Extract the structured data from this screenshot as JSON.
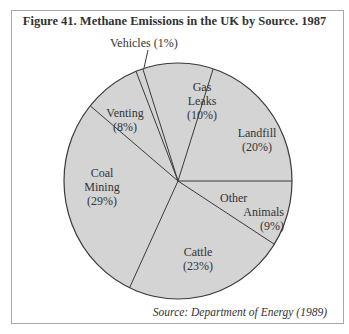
{
  "chart_data": {
    "type": "pie",
    "title": "Figure 41.  Methane Emissions in the UK by Source. 1987",
    "source": "Source: Department of Energy (1989)",
    "slices": [
      {
        "label": "Landfill",
        "value": 20,
        "display": "(20%)"
      },
      {
        "label": "Other Animals",
        "value": 9,
        "display": "(9%)"
      },
      {
        "label": "Cattle",
        "value": 23,
        "display": "(23%)"
      },
      {
        "label": "Coal Mining",
        "value": 29,
        "display": "(29%)"
      },
      {
        "label": "Venting",
        "value": 8,
        "display": "(8%)"
      },
      {
        "label": "Vehicles",
        "value": 1,
        "display": "(1%)"
      },
      {
        "label": "Gas Leaks",
        "value": 10,
        "display": "(10%)"
      }
    ],
    "colors": {
      "fill": "#d4d4d4",
      "stroke": "#3a3a3a",
      "frame": "#a8a8a8"
    }
  },
  "labels": {
    "vehicles": "Vehicles (1%)",
    "gas_1": "Gas",
    "gas_2": "Leaks",
    "gas_3": "(10%)",
    "landfill_1": "Landfill",
    "landfill_2": "(20%)",
    "venting_1": "Venting",
    "venting_2": "(8%)",
    "coal_1": "Coal",
    "coal_2": "Mining",
    "coal_3": "(29%)",
    "other_1": "Other",
    "other_2": "Animals",
    "other_3": "(9%)",
    "cattle_1": "Cattle",
    "cattle_2": "(23%)"
  }
}
